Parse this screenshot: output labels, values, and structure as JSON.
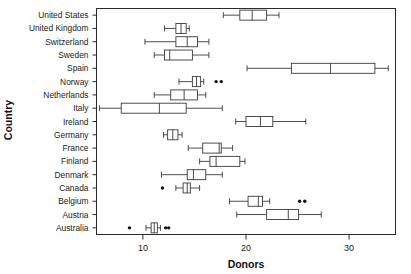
{
  "chart_data": {
    "type": "boxplot",
    "title": "",
    "xlabel": "Donors",
    "ylabel": "Country",
    "xlim": [
      5.5,
      34.5
    ],
    "xticks": [
      10,
      20,
      30
    ],
    "xticklabels": [
      "10",
      "20",
      "30"
    ],
    "grid": false,
    "legend": null,
    "orientation": "horizontal",
    "categories": [
      "United States",
      "United Kingdom",
      "Switzerland",
      "Sweden",
      "Spain",
      "Norway",
      "Netherlands",
      "Italy",
      "Ireland",
      "Germany",
      "France",
      "Finland",
      "Denmark",
      "Canada",
      "Belgium",
      "Austria",
      "Australia"
    ],
    "boxes": [
      {
        "category": "United States",
        "whisker_low": 17.8,
        "q1": 19.4,
        "median": 20.6,
        "q3": 22.0,
        "whisker_high": 23.2,
        "outliers": []
      },
      {
        "category": "United Kingdom",
        "whisker_low": 12.1,
        "q1": 13.2,
        "median": 13.7,
        "q3": 14.2,
        "whisker_high": 14.5,
        "outliers": []
      },
      {
        "category": "Switzerland",
        "whisker_low": 10.2,
        "q1": 13.2,
        "median": 14.3,
        "q3": 15.3,
        "whisker_high": 16.4,
        "outliers": []
      },
      {
        "category": "Sweden",
        "whisker_low": 11.1,
        "q1": 12.1,
        "median": 12.6,
        "q3": 14.8,
        "whisker_high": 16.4,
        "outliers": []
      },
      {
        "category": "Spain",
        "whisker_low": 20.1,
        "q1": 24.4,
        "median": 28.2,
        "q3": 32.5,
        "whisker_high": 33.8,
        "outliers": []
      },
      {
        "category": "Norway",
        "whisker_low": 13.5,
        "q1": 14.8,
        "median": 15.2,
        "q3": 15.6,
        "whisker_high": 15.9,
        "outliers": [
          17.1,
          17.6
        ]
      },
      {
        "category": "Netherlands",
        "whisker_low": 11.1,
        "q1": 12.7,
        "median": 14.0,
        "q3": 15.3,
        "whisker_high": 16.1,
        "outliers": []
      },
      {
        "category": "Italy",
        "whisker_low": 5.8,
        "q1": 7.9,
        "median": 11.6,
        "q3": 14.2,
        "whisker_high": 17.7,
        "outliers": []
      },
      {
        "category": "Ireland",
        "whisker_low": 19.0,
        "q1": 20.0,
        "median": 21.4,
        "q3": 22.6,
        "whisker_high": 25.8,
        "outliers": []
      },
      {
        "category": "Germany",
        "whisker_low": 12.0,
        "q1": 12.4,
        "median": 12.9,
        "q3": 13.4,
        "whisker_high": 13.8,
        "outliers": []
      },
      {
        "category": "France",
        "whisker_low": 14.4,
        "q1": 15.8,
        "median": 17.4,
        "q3": 17.6,
        "whisker_high": 18.7,
        "outliers": []
      },
      {
        "category": "Finland",
        "whisker_low": 15.5,
        "q1": 16.5,
        "median": 17.1,
        "q3": 19.4,
        "whisker_high": 19.9,
        "outliers": []
      },
      {
        "category": "Denmark",
        "whisker_low": 11.8,
        "q1": 14.3,
        "median": 14.9,
        "q3": 16.1,
        "whisker_high": 17.7,
        "outliers": []
      },
      {
        "category": "Canada",
        "whisker_low": 13.2,
        "q1": 13.9,
        "median": 14.3,
        "q3": 14.6,
        "whisker_high": 15.5,
        "outliers": [
          11.9
        ]
      },
      {
        "category": "Belgium",
        "whisker_low": 18.4,
        "q1": 20.2,
        "median": 21.2,
        "q3": 21.6,
        "whisker_high": 22.3,
        "outliers": [
          25.2,
          25.7
        ]
      },
      {
        "category": "Austria",
        "whisker_low": 19.1,
        "q1": 22.0,
        "median": 24.1,
        "q3": 25.1,
        "whisker_high": 27.3,
        "outliers": []
      },
      {
        "category": "Australia",
        "whisker_low": 10.3,
        "q1": 10.8,
        "median": 11.1,
        "q3": 11.4,
        "whisker_high": 11.7,
        "outliers": [
          8.7,
          12.2,
          12.5
        ]
      }
    ]
  },
  "axes": {
    "x_title": "Donors",
    "y_title": "Country"
  }
}
